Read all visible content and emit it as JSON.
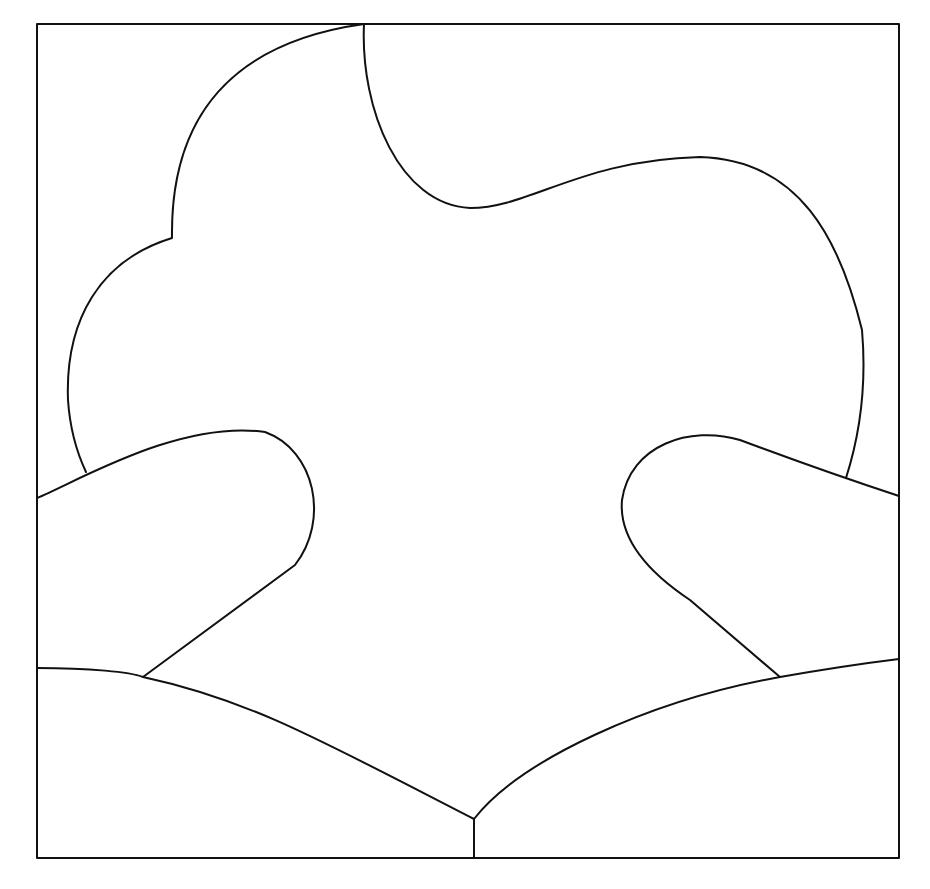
{
  "figure": {
    "type": "line-drawing",
    "stroke_color": "#111111",
    "background": "#ffffff",
    "frame": {
      "x": 37,
      "y": 24,
      "width": 862,
      "height": 834
    },
    "regions": [
      "cloud-shape",
      "left-hand-shape",
      "right-hand-shape",
      "left-base-shape",
      "right-base-shape"
    ]
  }
}
